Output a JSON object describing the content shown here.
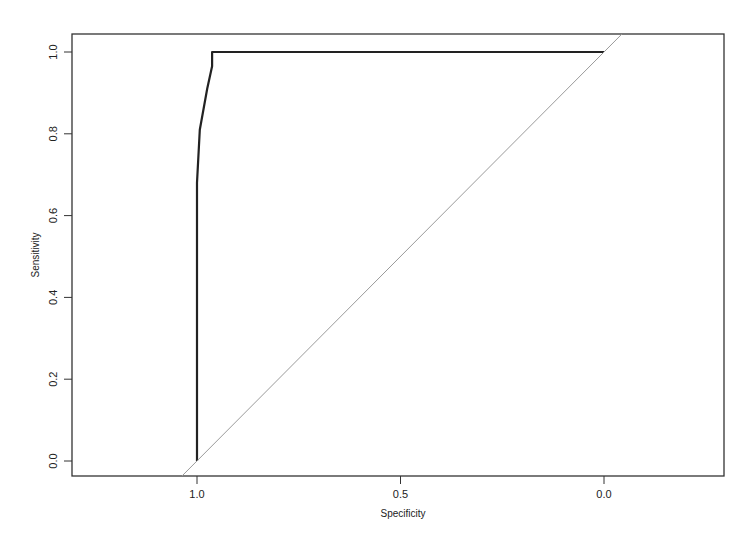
{
  "chart_data": {
    "type": "line",
    "title": "",
    "xlabel": "Specificity",
    "ylabel": "Sensitivity",
    "xlim": [
      1.0,
      0.0
    ],
    "ylim": [
      0.0,
      1.0
    ],
    "x_reversed": true,
    "grid": false,
    "legend": null,
    "x_ticks": [
      "1.0",
      "0.5",
      "0.0"
    ],
    "y_ticks": [
      "0.0",
      "0.2",
      "0.4",
      "0.6",
      "0.8",
      "1.0"
    ],
    "series": [
      {
        "name": "ROC curve",
        "color": "#222222",
        "points": [
          {
            "specificity": 1.0,
            "sensitivity": 0.0
          },
          {
            "specificity": 1.0,
            "sensitivity": 0.68
          },
          {
            "specificity": 0.993,
            "sensitivity": 0.81
          },
          {
            "specificity": 0.975,
            "sensitivity": 0.91
          },
          {
            "specificity": 0.963,
            "sensitivity": 0.965
          },
          {
            "specificity": 0.963,
            "sensitivity": 1.0
          },
          {
            "specificity": 0.0,
            "sensitivity": 1.0
          }
        ]
      },
      {
        "name": "reference diagonal",
        "color": "#9a9a9a",
        "points": [
          {
            "specificity": 1.0,
            "sensitivity": 0.0
          },
          {
            "specificity": 0.0,
            "sensitivity": 1.0
          }
        ]
      }
    ]
  },
  "axes": {
    "x_label": "Specificity",
    "y_label": "Sensitivity",
    "x_ticks": [
      {
        "value": 1.0,
        "label": "1.0"
      },
      {
        "value": 0.5,
        "label": "0.5"
      },
      {
        "value": 0.0,
        "label": "0.0"
      }
    ],
    "y_ticks": [
      {
        "value": 0.0,
        "label": "0.0"
      },
      {
        "value": 0.2,
        "label": "0.2"
      },
      {
        "value": 0.4,
        "label": "0.4"
      },
      {
        "value": 0.6,
        "label": "0.6"
      },
      {
        "value": 0.8,
        "label": "0.8"
      },
      {
        "value": 1.0,
        "label": "1.0"
      }
    ]
  }
}
